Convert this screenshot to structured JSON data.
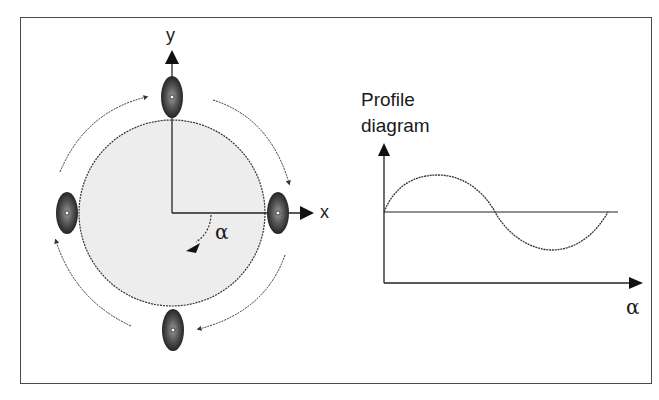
{
  "diagram": {
    "left_panel": {
      "axis_y_label": "y",
      "axis_x_label": "x",
      "angle_label": "α",
      "wheel_positions": [
        "top",
        "right",
        "bottom",
        "left"
      ],
      "rotation_direction": "clockwise"
    },
    "right_panel": {
      "title_line1": "Profile",
      "title_line2": "diagram",
      "x_axis_label": "α"
    },
    "colors": {
      "frame": "#4a4a4a",
      "circle_fill": "#ededed",
      "line": "#222222",
      "wheel_dark": "#1e1e1e",
      "wheel_mid": "#6a6a6a"
    }
  }
}
